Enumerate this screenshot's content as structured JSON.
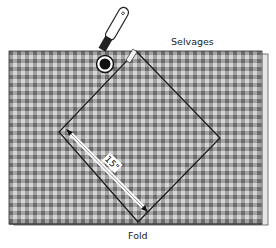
{
  "diagram": {
    "labels": {
      "selvages": "Selvages",
      "fold": "Fold",
      "measurement": "15\""
    },
    "colors": {
      "fabric_light": "#d4d4d4",
      "fabric_mid": "#9c9c9c",
      "fabric_dark": "#6e6e6e",
      "outline": "#1a1a1a",
      "background": "#ffffff"
    },
    "fabric": {
      "x": 9,
      "y": 51,
      "width": 253,
      "height": 173,
      "check_size_px": 8
    },
    "square": {
      "top": [
        136,
        51
      ],
      "right": [
        220,
        138
      ],
      "bottom": [
        138,
        222
      ],
      "left": [
        59,
        132
      ]
    },
    "tool": "rotary-cutter"
  }
}
